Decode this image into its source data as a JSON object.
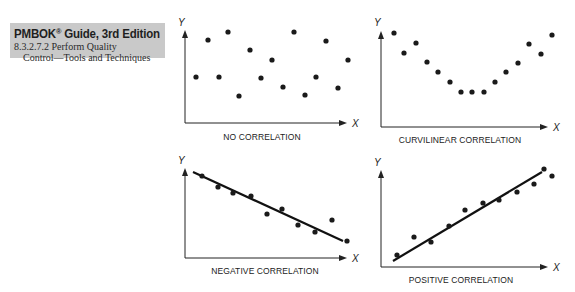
{
  "header": {
    "title": "PMBOK",
    "title_sup": "®",
    "title_rest": " Guide, 3rd Edition",
    "section_line1": "8.3.2.7.2 Perform Quality",
    "section_line2": "Control—Tools and Techniques"
  },
  "colors": {
    "header_bg": "#c9c9c9",
    "ink": "#222222"
  },
  "chart_data": [
    {
      "type": "scatter",
      "title": "NO CORRELATION",
      "xlabel": "X",
      "ylabel": "Y",
      "trendline": false,
      "points": [
        [
          1,
          5
        ],
        [
          2,
          8.5
        ],
        [
          3,
          5
        ],
        [
          4,
          9.5
        ],
        [
          5,
          3.2
        ],
        [
          6,
          7.6
        ],
        [
          7,
          4.9
        ],
        [
          8,
          6.5
        ],
        [
          9,
          4
        ],
        [
          10,
          9.5
        ],
        [
          11,
          3.3
        ],
        [
          12,
          5
        ],
        [
          13,
          8.5
        ],
        [
          14,
          3.9
        ],
        [
          15,
          6.5
        ]
      ]
    },
    {
      "type": "scatter",
      "title": "CURVILINEAR CORRELATION",
      "xlabel": "X",
      "ylabel": "Y",
      "trendline": false,
      "points": [
        [
          1,
          9.8
        ],
        [
          2,
          7.7
        ],
        [
          3,
          8.8
        ],
        [
          4,
          6.8
        ],
        [
          5,
          5.8
        ],
        [
          6,
          4.7
        ],
        [
          7,
          3.7
        ],
        [
          8,
          3.7
        ],
        [
          9,
          3.7
        ],
        [
          10,
          4.7
        ],
        [
          11,
          5.8
        ],
        [
          12,
          6.7
        ],
        [
          13,
          8.7
        ],
        [
          14,
          7.6
        ],
        [
          15,
          9.6
        ]
      ]
    },
    {
      "type": "scatter",
      "title": "NEGATIVE CORRELATION",
      "xlabel": "X",
      "ylabel": "Y",
      "trendline": true,
      "points": [
        [
          1,
          9.3
        ],
        [
          2,
          8.1
        ],
        [
          3,
          7.4
        ],
        [
          4,
          7.1
        ],
        [
          5,
          5
        ],
        [
          6,
          5.6
        ],
        [
          7,
          3.8
        ],
        [
          8,
          3
        ],
        [
          9,
          4.4
        ],
        [
          10,
          1.9
        ]
      ]
    },
    {
      "type": "scatter",
      "title": "POSITIVE CORRELATION",
      "xlabel": "X",
      "ylabel": "Y",
      "trendline": true,
      "points": [
        [
          1,
          1.3
        ],
        [
          2,
          3.2
        ],
        [
          3,
          2.7
        ],
        [
          4,
          4.4
        ],
        [
          5,
          6
        ],
        [
          6,
          6.7
        ],
        [
          7,
          7.1
        ],
        [
          8,
          7.9
        ],
        [
          9,
          8.8
        ],
        [
          10,
          10.3
        ],
        [
          11,
          9.6
        ]
      ]
    }
  ],
  "plots": [
    {
      "caption": "NO CORRELATION",
      "y_letter": "Y",
      "x_letter": "X",
      "axis": {
        "x0": 185,
        "ytop": 30,
        "ybase": 123,
        "xend": 347
      },
      "dots": [
        [
          196,
          77
        ],
        [
          208,
          40
        ],
        [
          219,
          77
        ],
        [
          228,
          32
        ],
        [
          239,
          96
        ],
        [
          250,
          50
        ],
        [
          261,
          78
        ],
        [
          272,
          60
        ],
        [
          283,
          87
        ],
        [
          294,
          32
        ],
        [
          305,
          95
        ],
        [
          316,
          77
        ],
        [
          326,
          41
        ],
        [
          338,
          88
        ],
        [
          348,
          60
        ]
      ],
      "line": null,
      "caption_xy": [
        262,
        140
      ],
      "y_letter_xy": [
        178,
        26
      ],
      "x_letter_xy": [
        352,
        127
      ]
    },
    {
      "caption": "CURVILINEAR CORRELATION",
      "y_letter": "Y",
      "x_letter": "X",
      "axis": {
        "x0": 381,
        "ytop": 31,
        "ybase": 127,
        "xend": 548
      },
      "dots": [
        [
          394,
          33
        ],
        [
          404,
          53
        ],
        [
          416,
          43
        ],
        [
          427,
          62
        ],
        [
          438,
          72
        ],
        [
          450,
          82
        ],
        [
          461,
          92
        ],
        [
          472,
          92
        ],
        [
          484,
          92
        ],
        [
          495,
          82
        ],
        [
          506,
          72
        ],
        [
          518,
          63
        ],
        [
          529,
          44
        ],
        [
          541,
          54
        ],
        [
          552,
          35
        ]
      ],
      "line": null,
      "caption_xy": [
        460,
        143
      ],
      "y_letter_xy": [
        374,
        26
      ],
      "x_letter_xy": [
        553,
        131
      ]
    },
    {
      "caption": "NEGATIVE CORRELATION",
      "y_letter": "Y",
      "x_letter": "X",
      "axis": {
        "x0": 185,
        "ytop": 168,
        "ybase": 258,
        "xend": 347
      },
      "dots": [
        [
          202,
          176
        ],
        [
          218,
          187
        ],
        [
          233,
          193
        ],
        [
          251,
          196
        ],
        [
          267,
          214
        ],
        [
          282,
          209
        ],
        [
          298,
          225
        ],
        [
          315,
          232
        ],
        [
          332,
          220
        ],
        [
          347,
          241
        ]
      ],
      "line": [
        193,
        172,
        343,
        241
      ],
      "caption_xy": [
        265,
        274
      ],
      "y_letter_xy": [
        178,
        164
      ],
      "x_letter_xy": [
        352,
        262
      ]
    },
    {
      "caption": "POSITIVE CORRELATION",
      "y_letter": "Y",
      "x_letter": "X",
      "axis": {
        "x0": 381,
        "ytop": 170,
        "ybase": 267,
        "xend": 548
      },
      "dots": [
        [
          397,
          255
        ],
        [
          414,
          237
        ],
        [
          431,
          242
        ],
        [
          449,
          226
        ],
        [
          465,
          210
        ],
        [
          483,
          203
        ],
        [
          499,
          200
        ],
        [
          517,
          192
        ],
        [
          534,
          184
        ],
        [
          544,
          169
        ],
        [
          552,
          176
        ]
      ],
      "line": [
        393,
        261,
        542,
        172
      ],
      "caption_xy": [
        461,
        283
      ],
      "y_letter_xy": [
        374,
        166
      ],
      "x_letter_xy": [
        553,
        271
      ]
    }
  ]
}
